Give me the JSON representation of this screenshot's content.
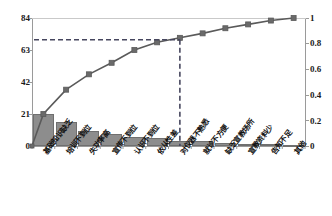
{
  "chart_data": {
    "type": "bar",
    "title": "",
    "subtitle": "",
    "xlabel": "",
    "ylabel": "",
    "ylabel_right": "",
    "grid": false,
    "legend": "none",
    "categories": [
      "基础知识缺乏",
      "培训不到位",
      "失功率高",
      "宣传不到位",
      "认识不到位",
      "依从性差",
      "对仪器不熟悉",
      "就诊不方便",
      "缺乏宣教场所",
      "宣教资料少",
      "告知不足",
      "其他"
    ],
    "values": [
      21,
      16,
      10,
      8,
      6,
      5,
      3,
      3,
      2,
      1.5,
      1,
      0.5
    ],
    "cumulative_percent": [
      0.25,
      0.44,
      0.56,
      0.65,
      0.75,
      0.81,
      0.845,
      0.88,
      0.92,
      0.95,
      0.98,
      1.0
    ],
    "ylim": [
      0,
      84
    ],
    "yticks_left": [
      "0",
      "21",
      "42",
      "63",
      "84"
    ],
    "ylim_right": [
      0,
      1
    ],
    "yticks_right": [
      "0",
      "0.2",
      "0.4",
      "0.6",
      "0.8",
      "1"
    ],
    "reference_line": {
      "value": 0.83,
      "style": "dashed",
      "vertical_at_category_index": 6
    },
    "colors": {
      "bar_fill": "#8d8d8d",
      "bar_stroke": "#6f6f6f",
      "line": "#5a5a5a",
      "marker": "#6a6a6a",
      "axis": "#9a9a9a",
      "dashed": "#4a4a6a",
      "text": "#111111"
    }
  }
}
